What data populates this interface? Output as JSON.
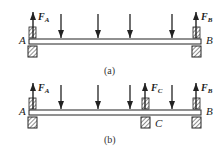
{
  "figure": {
    "panels": [
      {
        "id": "a",
        "caption": "(a)",
        "point_labels": {
          "left": "A",
          "right": "B"
        },
        "reactions": [
          {
            "symbol": "F",
            "subscript": "A",
            "at": "left"
          },
          {
            "symbol": "F",
            "subscript": "B",
            "at": "right"
          }
        ],
        "support_count": 2,
        "load_count": 4
      },
      {
        "id": "b",
        "caption": "(b)",
        "point_labels": {
          "left": "A",
          "middle": "C",
          "right": "B"
        },
        "reactions": [
          {
            "symbol": "F",
            "subscript": "A",
            "at": "left"
          },
          {
            "symbol": "F",
            "subscript": "C",
            "at": "middle"
          },
          {
            "symbol": "F",
            "subscript": "B",
            "at": "right"
          }
        ],
        "support_count": 3,
        "load_count": 4
      }
    ],
    "colors": {
      "ink": "#222222",
      "background": "#ffffff"
    }
  }
}
